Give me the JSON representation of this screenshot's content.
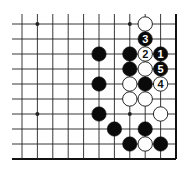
{
  "diagram": {
    "type": "go-board-corner",
    "grid": {
      "columns": 11,
      "rows": 10,
      "origin_x": 22,
      "origin_y": 24,
      "spacing_x": 15.4,
      "spacing_y": 15,
      "left_extend": 12,
      "top_extend": 14,
      "edges": [
        "right",
        "bottom"
      ],
      "line_color": "#222222",
      "edge_color": "#111111"
    },
    "star_points": [
      {
        "col": 1,
        "row": 0
      },
      {
        "col": 7,
        "row": 0
      },
      {
        "col": 1,
        "row": 6
      },
      {
        "col": 7,
        "row": 6
      }
    ],
    "stones": [
      {
        "col": 8,
        "row": 0,
        "color": "white",
        "label": ""
      },
      {
        "col": 8,
        "row": 1,
        "color": "black",
        "label": "3"
      },
      {
        "col": 5,
        "row": 2,
        "color": "black",
        "label": ""
      },
      {
        "col": 7,
        "row": 2,
        "color": "black",
        "label": ""
      },
      {
        "col": 8,
        "row": 2,
        "color": "white",
        "label": "2"
      },
      {
        "col": 9,
        "row": 2,
        "color": "black",
        "label": "1"
      },
      {
        "col": 7,
        "row": 3,
        "color": "black",
        "label": ""
      },
      {
        "col": 8,
        "row": 3,
        "color": "white",
        "label": ""
      },
      {
        "col": 9,
        "row": 3,
        "color": "black",
        "label": "5"
      },
      {
        "col": 5,
        "row": 4,
        "color": "black",
        "label": ""
      },
      {
        "col": 7,
        "row": 4,
        "color": "white",
        "label": ""
      },
      {
        "col": 8,
        "row": 4,
        "color": "black",
        "label": ""
      },
      {
        "col": 9,
        "row": 4,
        "color": "white",
        "label": "4"
      },
      {
        "col": 7,
        "row": 5,
        "color": "white",
        "label": ""
      },
      {
        "col": 8,
        "row": 5,
        "color": "white",
        "label": ""
      },
      {
        "col": 5,
        "row": 6,
        "color": "black",
        "label": ""
      },
      {
        "col": 9,
        "row": 6,
        "color": "white",
        "label": ""
      },
      {
        "col": 6,
        "row": 7,
        "color": "black",
        "label": ""
      },
      {
        "col": 8,
        "row": 7,
        "color": "black",
        "label": ""
      },
      {
        "col": 7,
        "row": 8,
        "color": "black",
        "label": ""
      },
      {
        "col": 8,
        "row": 8,
        "color": "white",
        "label": ""
      },
      {
        "col": 9,
        "row": 8,
        "color": "black",
        "label": ""
      }
    ],
    "colors": {
      "black_stone": "#0a0a0a",
      "white_stone": "#ffffff",
      "stone_outline": "#111111",
      "background": "#ffffff"
    }
  }
}
